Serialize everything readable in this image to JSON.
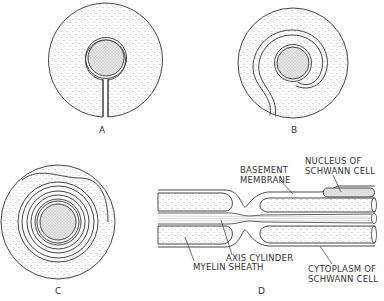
{
  "figure": {
    "panels": [
      {
        "id": "A",
        "label": "A"
      },
      {
        "id": "B",
        "label": "B"
      },
      {
        "id": "C",
        "label": "C"
      },
      {
        "id": "D",
        "label": "D"
      }
    ],
    "annotations": {
      "basement_membrane": [
        "BASEMENT",
        "MEMBRANE"
      ],
      "nucleus_of_schwann_cell": [
        "NUCLEUS OF",
        "SCHWANN CELL"
      ],
      "axis_cylinder": "AXIS CYLINDER",
      "myelin_sheath": "MYELIN SHEATH",
      "cytoplasm_of_schwann_cell": [
        "CYTOPLASM OF",
        "SCHWANN CELL"
      ]
    },
    "colors": {
      "line": "#333333",
      "stipple": "#8a8a8a",
      "axon_fill": "#d9d9d9",
      "background": "#ffffff"
    }
  }
}
